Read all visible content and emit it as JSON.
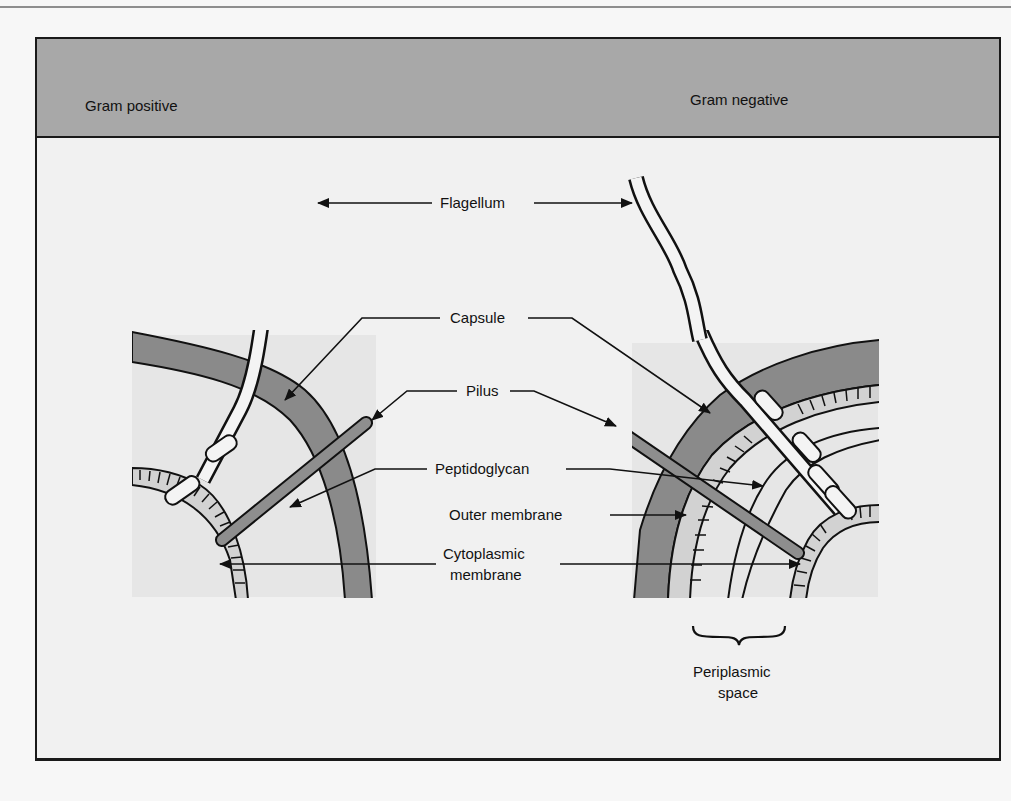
{
  "figure": {
    "header": {
      "left_title": "Gram positive",
      "right_title": "Gram negative"
    },
    "labels": {
      "flagellum": "Flagellum",
      "capsule": "Capsule",
      "pilus": "Pilus",
      "peptidoglycan": "Peptidoglycan",
      "outer_membrane": "Outer membrane",
      "cytoplasmic_line1": "Cytoplasmic",
      "cytoplasmic_line2": "membrane",
      "periplasmic_line1": "Periplasmic",
      "periplasmic_line2": "space"
    },
    "colors": {
      "header_band": "#a8a8a8",
      "frame_bg": "#f1f1f1",
      "panel_bg": "#e6e6e6",
      "capsule": "#8a8a8a",
      "membrane": "#d2d2d2",
      "pilus": "#8e8e8e",
      "flagellum": "#f4f4f4",
      "ink": "#111111"
    }
  }
}
